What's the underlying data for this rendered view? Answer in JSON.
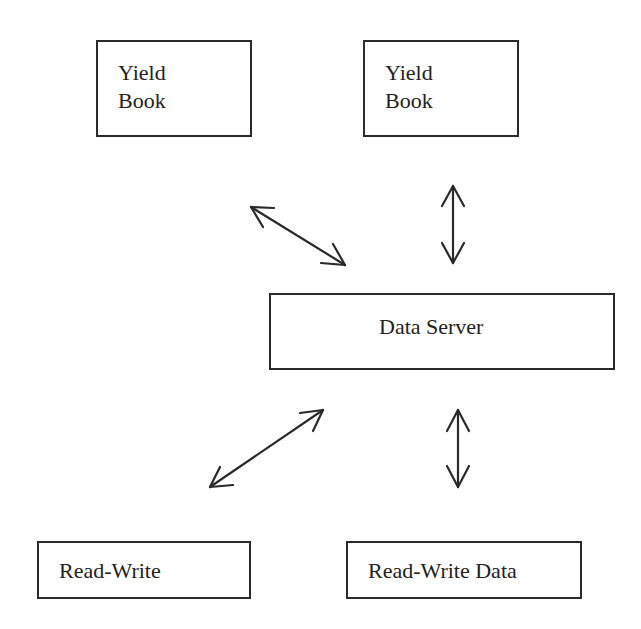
{
  "diagram": {
    "type": "architecture",
    "nodes": [
      {
        "id": "yield-book-1",
        "label_lines": [
          "Yield",
          "Book"
        ]
      },
      {
        "id": "yield-book-2",
        "label_lines": [
          "Yield",
          "Book"
        ]
      },
      {
        "id": "data-server",
        "label": "Data Server"
      },
      {
        "id": "read-write",
        "label": "Read-Write"
      },
      {
        "id": "read-write-data",
        "label": "Read-Write Data"
      }
    ],
    "edges": [
      {
        "from": "yield-book-1",
        "to": "data-server",
        "direction": "bidirectional"
      },
      {
        "from": "yield-book-2",
        "to": "data-server",
        "direction": "bidirectional"
      },
      {
        "from": "data-server",
        "to": "read-write",
        "direction": "bidirectional"
      },
      {
        "from": "data-server",
        "to": "read-write-data",
        "direction": "bidirectional"
      }
    ]
  },
  "colors": {
    "stroke": "#2a2a2a",
    "text": "#222222",
    "background": "#ffffff"
  }
}
